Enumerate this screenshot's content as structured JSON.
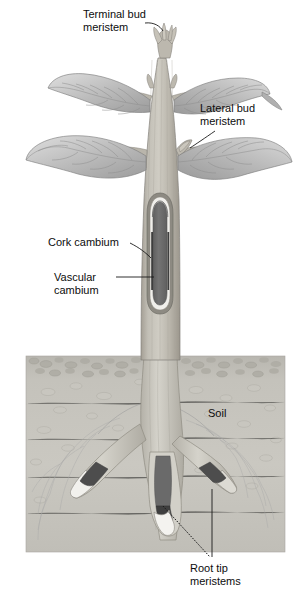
{
  "figure": {
    "background_color": "#ffffff",
    "width": 305,
    "height": 595
  },
  "labels": {
    "terminal_bud": {
      "line1": "Terminal bud",
      "line2": "meristem"
    },
    "lateral_bud": {
      "line1": "Lateral bud",
      "line2": "meristem"
    },
    "cork_cambium": {
      "line1": "Cork cambium"
    },
    "vascular_cambium": {
      "line1": "Vascular",
      "line2": "cambium"
    },
    "soil": {
      "line1": "Soil"
    },
    "root_tip": {
      "line1": "Root tip",
      "line2": "meristems"
    }
  },
  "colors": {
    "text": "#0d0d0d",
    "leader_line": "#1a1a1a",
    "stem_light": "#c9c6bd",
    "stem_mid": "#b3afa5",
    "stem_dark": "#97938a",
    "leaf_light": "#cdcdcd",
    "leaf_mid": "#b4b4b4",
    "leaf_dark": "#9a9a9a",
    "cutaway_core": "#6e6e6e",
    "cutaway_white": "#f2f1ed",
    "cutaway_band": "#4a4a4a",
    "soil_top_crust": "#b5b3ac",
    "soil_body": "#c6c4bd",
    "root_fill": "#cfcdc5",
    "root_cap_white": "#f4f3ef",
    "outline": "#6f6f6f"
  }
}
